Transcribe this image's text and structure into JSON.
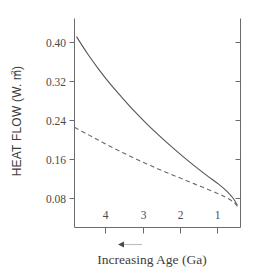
{
  "chart_data": {
    "type": "line",
    "title": "",
    "xlabel": "Increasing Age (Ga)",
    "ylabel": "HEAT FLOW (W. m²)",
    "ylabel_main": "HEAT FLOW (W. m",
    "ylabel_exponent": "2",
    "ylabel_close": ")",
    "grid": false,
    "legend": "none",
    "x_axis_direction_note": "Age increases to the left",
    "x_ticks": [
      "4",
      "3",
      "2",
      "1"
    ],
    "x_tick_values": [
      4,
      3,
      2,
      1
    ],
    "xlim": [
      4.62,
      0.44
    ],
    "y_ticks": [
      "0.40",
      "0.32",
      "0.24",
      "0.16",
      "0.08"
    ],
    "y_tick_values": [
      0.4,
      0.32,
      0.24,
      0.16,
      0.08
    ],
    "ylim": [
      0.037,
      0.432
    ],
    "series": [
      {
        "name": "solid-curve",
        "style": "solid",
        "color": "#555555",
        "x": [
          4.57,
          4.3,
          4.0,
          3.7,
          3.4,
          3.1,
          2.8,
          2.5,
          2.2,
          1.9,
          1.6,
          1.3,
          1.0,
          0.8,
          0.62,
          0.52
        ],
        "values": [
          0.412,
          0.378,
          0.344,
          0.313,
          0.285,
          0.258,
          0.233,
          0.21,
          0.188,
          0.167,
          0.147,
          0.128,
          0.11,
          0.096,
          0.08,
          0.066
        ]
      },
      {
        "name": "dashed-curve",
        "style": "dashed",
        "color": "#6a6a6a",
        "x": [
          4.62,
          4.3,
          4.0,
          3.7,
          3.4,
          3.1,
          2.8,
          2.5,
          2.2,
          1.9,
          1.6,
          1.3,
          1.0,
          0.8,
          0.62,
          0.52
        ],
        "values": [
          0.226,
          0.212,
          0.199,
          0.186,
          0.174,
          0.162,
          0.151,
          0.14,
          0.13,
          0.12,
          0.11,
          0.1,
          0.09,
          0.082,
          0.073,
          0.064
        ]
      }
    ],
    "annotations": [
      {
        "name": "age-direction-arrow",
        "symbol": "left-arrow",
        "label": ""
      }
    ]
  }
}
